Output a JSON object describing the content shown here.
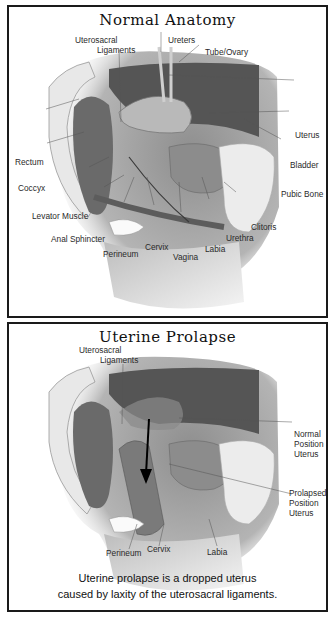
{
  "panels": [
    {
      "title": "Normal Anatomy",
      "labels": {
        "uterosacral_1": "Uterosacral",
        "uterosacral_2": "Ligaments",
        "ureters": "Ureters",
        "tube_ovary": "Tube/Ovary",
        "uterus": "Uterus",
        "rectum": "Rectum",
        "bladder": "Bladder",
        "coccyx": "Coccyx",
        "pubic_bone": "Pubic Bone",
        "levator_muscle": "Levator Muscle",
        "clitoris": "Clitoris",
        "anal_sphincter": "Anal Sphincter",
        "urethra": "Urethra",
        "cervix": "Cervix",
        "labia": "Labia",
        "perineum": "Perineum",
        "vagina": "Vagina"
      }
    },
    {
      "title": "Uterine Prolapse",
      "labels": {
        "uterosacral_1": "Uterosacral",
        "uterosacral_2": "Ligaments",
        "normal_1": "Normal",
        "normal_2": "Position",
        "normal_3": "Uterus",
        "prolapsed_1": "Prolapsed",
        "prolapsed_2": "Position",
        "prolapsed_3": "Uterus",
        "perineum": "Perineum",
        "cervix": "Cervix",
        "labia": "Labia"
      },
      "caption_line1": "Uterine prolapse is a dropped uterus",
      "caption_line2": "caused by laxity of the uterosacral ligaments."
    }
  ],
  "colors": {
    "border": "#1a1a1a",
    "tissue_dark": "#4a4a4a",
    "tissue_mid": "#8a8a8a",
    "tissue_light": "#c8c8c8",
    "bone": "#e6e6e6",
    "skin": "#d9d9d9"
  }
}
